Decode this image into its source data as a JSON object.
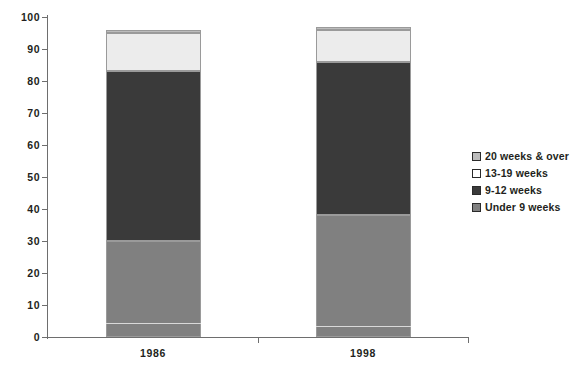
{
  "chart_data": {
    "type": "bar",
    "subtype": "100% stacked column",
    "title": "",
    "subtitle": "",
    "xlabel": "",
    "ylabel": "",
    "categories": [
      "1986",
      "1998"
    ],
    "ylim": [
      0,
      100
    ],
    "yticks": [
      0,
      10,
      20,
      30,
      40,
      50,
      60,
      70,
      80,
      90,
      100
    ],
    "ytick_labels": [
      "0",
      "10",
      "20",
      "30",
      "40",
      "50",
      "60",
      "70",
      "80",
      "90",
      "100"
    ],
    "grid": false,
    "legend_position": "right",
    "stack_order_bottom_to_top": [
      "Under 9 weeks",
      "9-12 weeks",
      "13-19 weeks",
      "20 weeks & over"
    ],
    "series": [
      {
        "name": "Under 9 weeks",
        "color": "#808080",
        "values": [
          30,
          38
        ]
      },
      {
        "name": "9-12 weeks",
        "color": "#3a3a3a",
        "values": [
          53,
          48
        ]
      },
      {
        "name": "13-19 weeks",
        "color": "#ececec",
        "values": [
          12,
          10
        ]
      },
      {
        "name": "20 weeks & over",
        "color": "#bcbcbc",
        "values": [
          1,
          1
        ]
      }
    ],
    "inner_rule_series": {
      "name": "inner separator",
      "values": [
        4,
        3
      ],
      "note": "thin light rule inside the lowest segment"
    },
    "cumulative_boundaries": {
      "1986": [
        4,
        34,
        87,
        99,
        100
      ],
      "1998": [
        3,
        41,
        89,
        99,
        100
      ]
    }
  },
  "legend": {
    "items": [
      {
        "label": "20 weeks & over",
        "color": "#bcbcbc"
      },
      {
        "label": "13-19 weeks",
        "color": "#ffffff"
      },
      {
        "label": "9-12 weeks",
        "color": "#3a3a3a"
      },
      {
        "label": "Under 9 weeks",
        "color": "#808080"
      }
    ]
  },
  "axes": {
    "y_labels": [
      "100",
      "90",
      "80",
      "70",
      "60",
      "50",
      "40",
      "30",
      "20",
      "10",
      "0"
    ],
    "x_labels": [
      "1986",
      "1998"
    ]
  },
  "colors": {
    "axis": "#6e6e6e",
    "text": "#231f20",
    "background": "#ffffff",
    "bar_outline": "#9a9a9a",
    "hairline": "#d9d9d9"
  }
}
